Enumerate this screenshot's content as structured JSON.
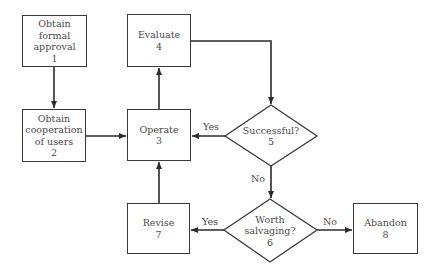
{
  "diagram": {
    "type": "flowchart",
    "nodes": [
      {
        "id": 1,
        "shape": "box",
        "lines": [
          "Obtain",
          "formal",
          "approval"
        ],
        "number": "1"
      },
      {
        "id": 2,
        "shape": "box",
        "lines": [
          "Obtain",
          "cooperation",
          "of users"
        ],
        "number": "2"
      },
      {
        "id": 3,
        "shape": "box",
        "lines": [
          "Operate"
        ],
        "number": "3"
      },
      {
        "id": 4,
        "shape": "box",
        "lines": [
          "Evaluate"
        ],
        "number": "4"
      },
      {
        "id": 5,
        "shape": "diamond",
        "lines": [
          "Successful?"
        ],
        "number": "5"
      },
      {
        "id": 6,
        "shape": "diamond",
        "lines": [
          "Worth",
          "salvaging?"
        ],
        "number": "6"
      },
      {
        "id": 7,
        "shape": "box",
        "lines": [
          "Revise"
        ],
        "number": "7"
      },
      {
        "id": 8,
        "shape": "box",
        "lines": [
          "Abandon"
        ],
        "number": "8"
      }
    ],
    "edges": [
      {
        "from": 1,
        "to": 2,
        "label": ""
      },
      {
        "from": 2,
        "to": 3,
        "label": ""
      },
      {
        "from": 3,
        "to": 4,
        "label": ""
      },
      {
        "from": 4,
        "to": 5,
        "label": ""
      },
      {
        "from": 5,
        "to": 3,
        "label": "Yes"
      },
      {
        "from": 5,
        "to": 6,
        "label": "No"
      },
      {
        "from": 6,
        "to": 7,
        "label": "Yes"
      },
      {
        "from": 6,
        "to": 8,
        "label": "No"
      },
      {
        "from": 7,
        "to": 3,
        "label": ""
      }
    ],
    "labels": {
      "yes_5": "Yes",
      "no_5": "No",
      "yes_6": "Yes",
      "no_6": "No"
    },
    "colors": {
      "line": "#2a2a2a",
      "text": "#4a4a4a",
      "background": "#ffffff"
    }
  }
}
